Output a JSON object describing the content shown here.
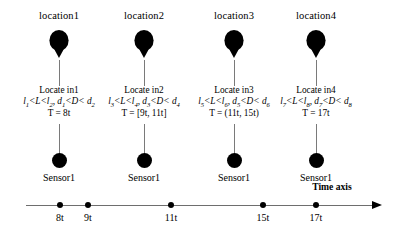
{
  "diagram": {
    "title_icon": "balloon-marker",
    "time_axis": {
      "caption": "Time axis",
      "ticks": [
        {
          "label": "8t",
          "x": 60
        },
        {
          "label": "9t",
          "x": 88
        },
        {
          "label": "11t",
          "x": 171
        },
        {
          "label": "15t",
          "x": 263
        },
        {
          "label": "17t",
          "x": 316
        }
      ]
    },
    "columns": [
      {
        "x": 59,
        "location_label": "location1",
        "sensor_label": "Sensor1",
        "info": {
          "line1": "Locate in1",
          "line2_parts": [
            {
              "t": "l",
              "sub": "1"
            },
            {
              "t": "<L<"
            },
            {
              "t": "l",
              "sub": "2"
            },
            {
              "t": ", "
            },
            {
              "t": "d",
              "sub": "1"
            },
            {
              "t": "<D< "
            },
            {
              "t": "d",
              "sub": "2"
            }
          ],
          "line3": "T = 8t"
        }
      },
      {
        "x": 144,
        "location_label": "location2",
        "sensor_label": "Sensor1",
        "info": {
          "line1": "Locate in2",
          "line2_parts": [
            {
              "t": "l",
              "sub": "3"
            },
            {
              "t": "<L<"
            },
            {
              "t": "l",
              "sub": "4"
            },
            {
              "t": ", "
            },
            {
              "t": "d",
              "sub": "3"
            },
            {
              "t": "<D< "
            },
            {
              "t": "d",
              "sub": "4"
            }
          ],
          "line3": "T = [9t, 11t]"
        }
      },
      {
        "x": 234,
        "location_label": "location3",
        "sensor_label": "Sensor1",
        "info": {
          "line1": "Locate in3",
          "line2_parts": [
            {
              "t": "l",
              "sub": "5"
            },
            {
              "t": "<L<"
            },
            {
              "t": "l",
              "sub": "6"
            },
            {
              "t": ", "
            },
            {
              "t": "d",
              "sub": "5"
            },
            {
              "t": "<D< "
            },
            {
              "t": "d",
              "sub": "6"
            }
          ],
          "line3": "T = (11t, 15t)"
        }
      },
      {
        "x": 316,
        "location_label": "location4",
        "sensor_label": "Sensor1",
        "info": {
          "line1": "Locate in4",
          "line2_parts": [
            {
              "t": "l",
              "sub": "7"
            },
            {
              "t": "<L<"
            },
            {
              "t": "l",
              "sub": "8"
            },
            {
              "t": ", "
            },
            {
              "t": "d",
              "sub": "7"
            },
            {
              "t": "<D< "
            },
            {
              "t": "d",
              "sub": "8"
            }
          ],
          "line3": "T = 17t"
        }
      }
    ],
    "colors": {
      "ink": "#000000",
      "line": "#6e6e6e",
      "string": "#7a7a7a",
      "background": "#ffffff"
    }
  }
}
